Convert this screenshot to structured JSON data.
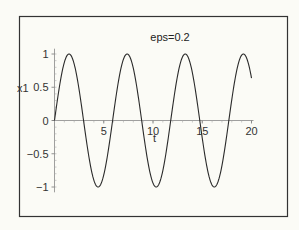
{
  "chart_data": {
    "type": "line",
    "title": "eps=0.2",
    "xlabel": "t",
    "ylabel": "x1",
    "xlim": [
      0,
      20
    ],
    "ylim": [
      -1,
      1
    ],
    "grid": false,
    "legend": null,
    "x_ticks": [
      5,
      10,
      15,
      20
    ],
    "x_tick_labels": [
      "5",
      "10",
      "15",
      "20"
    ],
    "y_ticks": [
      1,
      0.5,
      0,
      -0.5,
      -1
    ],
    "y_tick_labels": [
      "1",
      "0.5",
      "0",
      "−0.5",
      "−1"
    ],
    "series": [
      {
        "name": "x1",
        "color": "#2a2a2a",
        "x": [
          0,
          0.5,
          1,
          1.5,
          2,
          2.5,
          3,
          3.5,
          4,
          4.5,
          5,
          5.5,
          6,
          6.5,
          7,
          7.5,
          8,
          8.5,
          9,
          9.5,
          10,
          10.5,
          11,
          11.5,
          12,
          12.5,
          13,
          13.5,
          14,
          14.5,
          15,
          15.5,
          16,
          16.5,
          17,
          17.5,
          18,
          18.5,
          19,
          19.5,
          20
        ],
        "values": [
          0,
          0.5,
          0.87,
          1.0,
          0.85,
          0.46,
          -0.04,
          -0.53,
          -0.89,
          -1.0,
          -0.83,
          -0.43,
          0.07,
          0.55,
          0.9,
          0.99,
          0.81,
          0.4,
          -0.1,
          -0.58,
          -0.92,
          -0.99,
          -0.79,
          -0.36,
          0.13,
          0.6,
          0.93,
          0.99,
          0.77,
          0.33,
          -0.17,
          -0.63,
          -0.94,
          -0.98,
          -0.74,
          -0.29,
          0.2,
          0.65,
          0.95,
          0.97,
          0.64
        ]
      }
    ]
  },
  "plot": {
    "title": "eps=0.2",
    "xlabel": "t",
    "ylabel": "x1"
  }
}
